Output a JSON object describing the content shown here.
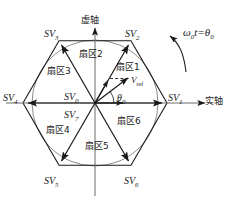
{
  "figure": {
    "type": "svpwm-hexagon-vector-diagram",
    "axes": {
      "imaginary_label": "虚轴",
      "real_label": "实轴"
    },
    "rotation_annotation": {
      "omega": "ω",
      "omega_sub": "0",
      "t": "t",
      "equals": "=",
      "theta": "θ",
      "theta_sub": "0",
      "full": "ω0t=θ0"
    },
    "reference_vector": {
      "label": "V",
      "label_sub": "ref",
      "angle_label": "θ",
      "angle_sub": "0"
    },
    "zero_vectors": [
      {
        "label": "SV",
        "sub": "0"
      },
      {
        "label": "SV",
        "sub": "7"
      }
    ],
    "vertices": [
      {
        "name": "SV",
        "sub": "1",
        "angle_deg": 0
      },
      {
        "name": "SV",
        "sub": "2",
        "angle_deg": 60
      },
      {
        "name": "SV",
        "sub": "3",
        "angle_deg": 120
      },
      {
        "name": "SV",
        "sub": "4",
        "angle_deg": 180
      },
      {
        "name": "SV",
        "sub": "5",
        "angle_deg": 240
      },
      {
        "name": "SV",
        "sub": "6",
        "angle_deg": 300
      }
    ],
    "sectors": [
      {
        "label": "扇区1",
        "index": 1
      },
      {
        "label": "扇区2",
        "index": 2
      },
      {
        "label": "扇区3",
        "index": 3
      },
      {
        "label": "扇区4",
        "index": 4
      },
      {
        "label": "扇区5",
        "index": 5
      },
      {
        "label": "扇区6",
        "index": 6
      }
    ],
    "colors": {
      "stroke": "#1a1a1a",
      "text": "#1a1a1a",
      "background": "#ffffff"
    }
  }
}
